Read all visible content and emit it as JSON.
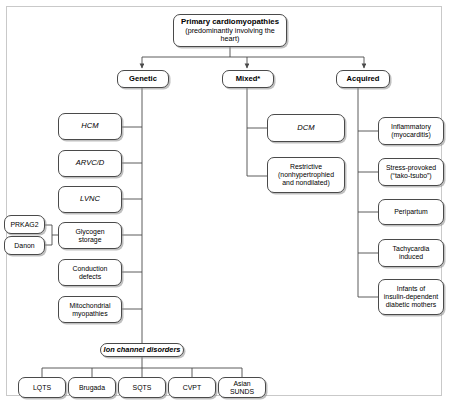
{
  "figure": {
    "root": {
      "title": "Primary cardiomyopathies",
      "subtitle": "(predominantly involving the heart)"
    },
    "categories": [
      {
        "id": "genetic",
        "label": "Genetic"
      },
      {
        "id": "mixed",
        "label": "Mixed*"
      },
      {
        "id": "acquired",
        "label": "Acquired"
      }
    ],
    "genetic_items": [
      {
        "label": "HCM"
      },
      {
        "label": "ARVC/D"
      },
      {
        "label": "LVNC"
      },
      {
        "label": "Glycogen\nstorage"
      },
      {
        "label": "Conduction\ndefects"
      },
      {
        "label": "Mitochondrial\nmyopathies"
      }
    ],
    "glycogen_subtypes": [
      {
        "label": "PRKAG2"
      },
      {
        "label": "Danon"
      }
    ],
    "ion_channel": {
      "label": "Ion channel disorders"
    },
    "ion_channel_items": [
      {
        "label": "LQTS"
      },
      {
        "label": "Brugada"
      },
      {
        "label": "SQTS"
      },
      {
        "label": "CVPT"
      },
      {
        "label": "Asian\nSUNDS"
      }
    ],
    "mixed_items": [
      {
        "label": "DCM"
      },
      {
        "label": "Restrictive\n(nonhypertrophied\nand nondilated)"
      }
    ],
    "acquired_items": [
      {
        "label": "Inflammatory\n(myocarditis)"
      },
      {
        "label": "Stress-provoked\n(“tako-tsubo”)"
      },
      {
        "label": "Peripartum"
      },
      {
        "label": "Tachycardia\ninduced"
      },
      {
        "label": "Infants of\ninsulin-dependent\ndiabetic mothers"
      }
    ],
    "colors": {
      "line": "#4a4a4a",
      "box_border": "#4a4a4a",
      "box_fill": "#ffffff",
      "frame": "#c9c9c9",
      "text": "#000000"
    }
  }
}
